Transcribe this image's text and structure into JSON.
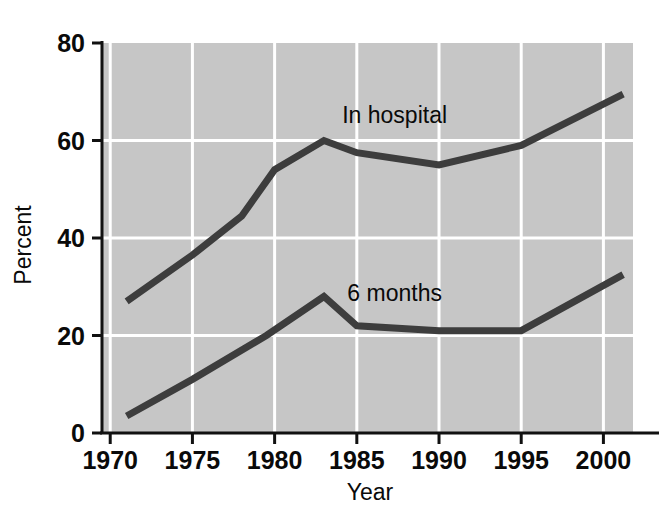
{
  "chart_data": {
    "type": "line",
    "title": "",
    "subtitle": "",
    "xlabel": "Year",
    "ylabel": "Percent",
    "xlim": [
      1969.5,
      2001.8
    ],
    "ylim": [
      0,
      80
    ],
    "grid": "horizontal-and-vertical-white-gridlines",
    "legend_position": "inline-annotation",
    "x_ticks": [
      1970,
      1975,
      1980,
      1985,
      1990,
      1995,
      2000
    ],
    "x_tick_labels": [
      "1970",
      "1975",
      "1980",
      "1985",
      "1990",
      "1995",
      "2000"
    ],
    "y_ticks": [
      0,
      20,
      40,
      60,
      80
    ],
    "y_tick_labels": [
      "0",
      "20",
      "40",
      "60",
      "80"
    ],
    "plot_background_color": "#c6c6c6",
    "gridline_color": "#ffffff",
    "axis_color": "#111111",
    "series": [
      {
        "name": "In hospital",
        "label": "In hospital",
        "color": "#3d3d3d",
        "label_x": 1987.3,
        "label_y": 63.5,
        "x": [
          1971.0,
          1975.0,
          1978.0,
          1980.0,
          1983.0,
          1985.0,
          1990.0,
          1995.0,
          2001.2
        ],
        "values": [
          27.0,
          36.5,
          44.5,
          54.0,
          60.0,
          57.5,
          55.0,
          59.0,
          69.5
        ]
      },
      {
        "name": "6 months",
        "label": "6 months",
        "color": "#3d3d3d",
        "label_x": 1987.3,
        "label_y": 27.0,
        "x": [
          1971.0,
          1975.0,
          1979.5,
          1983.0,
          1985.0,
          1990.0,
          1995.0,
          2001.2
        ],
        "values": [
          3.5,
          11.0,
          20.0,
          28.0,
          22.0,
          21.0,
          21.0,
          32.5
        ]
      }
    ]
  },
  "axes": {
    "y_axis_title": "Percent",
    "x_axis_title": "Year"
  }
}
